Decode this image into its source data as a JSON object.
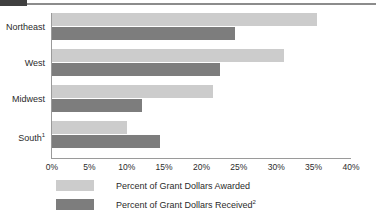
{
  "chart_data": {
    "type": "bar",
    "orientation": "horizontal",
    "title": "",
    "xlabel": "",
    "ylabel": "",
    "categories": [
      "Northeast",
      "West",
      "Midwest",
      "South"
    ],
    "category_labels": [
      {
        "text": "Northeast",
        "footnote": ""
      },
      {
        "text": "West",
        "footnote": ""
      },
      {
        "text": "Midwest",
        "footnote": ""
      },
      {
        "text": "South",
        "footnote": "1"
      }
    ],
    "series": [
      {
        "name": "Percent of Grant Dollars Awarded",
        "footnote": "",
        "color": "#cccccc",
        "values": [
          35.5,
          31.0,
          21.5,
          10.0
        ]
      },
      {
        "name": "Percent of Grant Dollars Received",
        "footnote": "2",
        "color": "#7d7d7d",
        "values": [
          24.5,
          22.5,
          12.0,
          14.5
        ]
      }
    ],
    "xlim": [
      0,
      40
    ],
    "xticks": [
      0,
      5,
      10,
      15,
      20,
      25,
      30,
      35,
      40
    ],
    "xtick_labels": [
      "0%",
      "5%",
      "10%",
      "15%",
      "20%",
      "25%",
      "30%",
      "35%",
      "40%"
    ],
    "grid": false,
    "legend_position": "bottom-left"
  },
  "colors": {
    "awarded": "#cccccc",
    "received": "#7d7d7d",
    "axis": "#9a9a9a",
    "text": "#2b2b2b",
    "top_rule": "#8c8c8c",
    "top_tab": "#3f3f3f"
  }
}
